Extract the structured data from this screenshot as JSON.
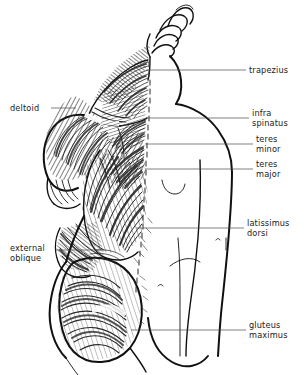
{
  "figure": {
    "kind": "anatomical-illustration",
    "view": "posterior",
    "style": "black and white line drawing with hatched shading",
    "background_color": "#ffffff",
    "ink_color": "#101010",
    "leader_color": "#4a4a4a"
  },
  "labels": [
    {
      "id": "trapezius",
      "lines": [
        "trapezius"
      ],
      "side": "right",
      "text_x": 249,
      "text_y": 71,
      "leader": {
        "x1": 146,
        "y1": 70,
        "x2": 246,
        "y2": 70
      }
    },
    {
      "id": "infraspinatus",
      "lines": [
        "infra",
        "spinatus"
      ],
      "side": "right",
      "text_x": 252,
      "text_y": 120,
      "leader": {
        "x1": 146,
        "y1": 118,
        "x2": 249,
        "y2": 118
      }
    },
    {
      "id": "teres-minor",
      "lines": [
        "teres",
        "minor"
      ],
      "side": "right",
      "text_x": 256,
      "text_y": 145,
      "leader": {
        "x1": 145,
        "y1": 144,
        "x2": 253,
        "y2": 144
      }
    },
    {
      "id": "teres-major",
      "lines": [
        "teres",
        "major"
      ],
      "side": "right",
      "text_x": 256,
      "text_y": 170,
      "leader": {
        "x1": 145,
        "y1": 169,
        "x2": 253,
        "y2": 169
      }
    },
    {
      "id": "latissimus-dorsi",
      "lines": [
        "latissimus",
        "dorsi"
      ],
      "side": "right",
      "text_x": 247,
      "text_y": 229,
      "leader": {
        "x1": 136,
        "y1": 228,
        "x2": 244,
        "y2": 228
      }
    },
    {
      "id": "gluteus-maximus",
      "lines": [
        "gluteus",
        "maximus"
      ],
      "side": "right",
      "text_x": 249,
      "text_y": 331,
      "leader": {
        "x1": 131,
        "y1": 330,
        "x2": 246,
        "y2": 330
      }
    },
    {
      "id": "deltoid",
      "lines": [
        "deltoid"
      ],
      "side": "left",
      "text_x": 12,
      "text_y": 110,
      "leader": {
        "x1": 51,
        "y1": 108,
        "x2": 74,
        "y2": 108
      }
    },
    {
      "id": "external-oblique",
      "lines": [
        "external",
        "oblique"
      ],
      "side": "left",
      "text_x": 12,
      "text_y": 253,
      "leader": {
        "x1": 55,
        "y1": 250,
        "x2": 98,
        "y2": 250
      }
    }
  ]
}
